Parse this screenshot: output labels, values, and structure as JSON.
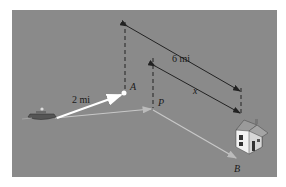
{
  "figure": {
    "background_color": "#8a8a8a",
    "labels": {
      "distance_to_A": "2 mi",
      "distance_total": "6 mi",
      "distance_x": "x",
      "point_A": "A",
      "point_P": "P",
      "point_B": "B"
    },
    "objects": {
      "boat": "boat",
      "house": "house"
    }
  }
}
